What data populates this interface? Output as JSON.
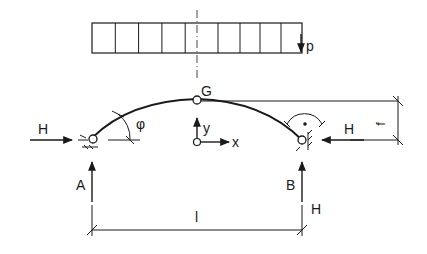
{
  "diagram": {
    "type": "three-hinged arch structural diagram",
    "labels": {
      "load": "p",
      "crown_hinge": "G",
      "angle": "φ",
      "axis_x": "x",
      "axis_y": "y",
      "left_support": "A",
      "right_support": "B",
      "left_thrust": "H",
      "right_thrust": "H",
      "right_thrust_below": "H",
      "rise": "f",
      "span": "l"
    },
    "colors": {
      "stroke": "#1a1a1a",
      "background": "#ffffff"
    },
    "load_block": {
      "cells": 9
    }
  }
}
